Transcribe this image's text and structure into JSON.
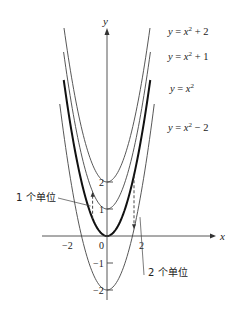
{
  "chart_data": {
    "type": "line",
    "title": "",
    "xlabel": "x",
    "ylabel": "y",
    "xlim": [
      -5.5,
      6
    ],
    "ylim": [
      -2.5,
      7.5
    ],
    "grid": false,
    "legend_position": "inline-right",
    "x_ticks": [
      -2,
      0,
      2
    ],
    "x_tick_labels": [
      "-2",
      "0",
      "2"
    ],
    "y_ticks": [
      2,
      1,
      -1,
      -2
    ],
    "y_tick_labels": [
      "2",
      "1",
      "-1",
      "-2"
    ],
    "series": [
      {
        "name": "y = x² + 2",
        "label_base": "y = x",
        "label_sup": "2",
        "label_tail": " + 2",
        "shift": 2,
        "emphasis": false
      },
      {
        "name": "y = x² + 1",
        "label_base": "y = x",
        "label_sup": "2",
        "label_tail": " + 1",
        "shift": 1,
        "emphasis": false
      },
      {
        "name": "y = x²",
        "label_base": "y = x",
        "label_sup": "2",
        "label_tail": "",
        "shift": 0,
        "emphasis": true
      },
      {
        "name": "y = x² − 2",
        "label_base": "y = x",
        "label_sup": "2",
        "label_tail": " − 2",
        "shift": -2,
        "emphasis": false
      }
    ],
    "annotations": [
      {
        "text": "1 个单位",
        "type": "dashed-arrow-up",
        "x": -0.8,
        "from_y": 0.64,
        "to_y": 1.64
      },
      {
        "text": "2 个单位",
        "type": "dashed-arrow-down",
        "x": 1.5,
        "from_y": 2.25,
        "to_y": 0.25
      }
    ]
  }
}
